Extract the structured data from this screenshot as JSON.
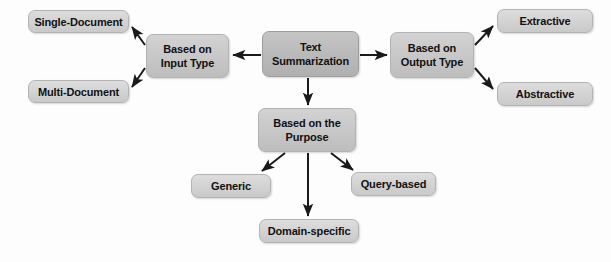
{
  "diagram": {
    "background_color": "#fdfdfd",
    "node_fill_root": "#bcbcbc",
    "node_fill_branch": "#c7c7c7",
    "node_fill_leaf": "#d4d4d4",
    "node_border_color": "#b3b3b3",
    "edge_color": "#1a1a1a",
    "nodes": [
      {
        "id": "text-summarization",
        "label": "Text\nSummarization",
        "role": "root",
        "x": 262,
        "y": 31,
        "w": 97,
        "h": 46
      },
      {
        "id": "based-on-input-type",
        "label": "Based on\nInput Type",
        "role": "branch",
        "x": 146,
        "y": 34,
        "w": 83,
        "h": 44
      },
      {
        "id": "based-on-output-type",
        "label": "Based on\nOutput Type",
        "role": "branch",
        "x": 390,
        "y": 32,
        "w": 84,
        "h": 46
      },
      {
        "id": "based-on-the-purpose",
        "label": "Based on the\nPurpose",
        "role": "branch",
        "x": 258,
        "y": 108,
        "w": 98,
        "h": 44
      },
      {
        "id": "single-document",
        "label": "Single-Document",
        "role": "leaf",
        "x": 28,
        "y": 10,
        "w": 101,
        "h": 23
      },
      {
        "id": "multi-document",
        "label": "Multi-Document",
        "role": "leaf",
        "x": 28,
        "y": 80,
        "w": 101,
        "h": 23
      },
      {
        "id": "extractive",
        "label": "Extractive",
        "role": "leaf",
        "x": 497,
        "y": 9,
        "w": 96,
        "h": 24
      },
      {
        "id": "abstractive",
        "label": "Abstractive",
        "role": "leaf",
        "x": 497,
        "y": 82,
        "w": 96,
        "h": 24
      },
      {
        "id": "generic",
        "label": "Generic",
        "role": "leaf",
        "x": 191,
        "y": 174,
        "w": 80,
        "h": 24
      },
      {
        "id": "query-based",
        "label": "Query-based",
        "role": "leaf",
        "x": 351,
        "y": 172,
        "w": 85,
        "h": 24
      },
      {
        "id": "domain-specific",
        "label": "Domain-specific",
        "role": "leaf",
        "x": 259,
        "y": 219,
        "w": 100,
        "h": 24
      }
    ],
    "edges": [
      {
        "id": "edge-root-to-input-type",
        "from": "text-summarization",
        "to": "based-on-input-type"
      },
      {
        "id": "edge-root-to-output-type",
        "from": "text-summarization",
        "to": "based-on-output-type"
      },
      {
        "id": "edge-root-to-purpose",
        "from": "text-summarization",
        "to": "based-on-the-purpose"
      },
      {
        "id": "edge-input-type-to-single-document",
        "from": "based-on-input-type",
        "to": "single-document"
      },
      {
        "id": "edge-input-type-to-multi-document",
        "from": "based-on-input-type",
        "to": "multi-document"
      },
      {
        "id": "edge-output-type-to-extractive",
        "from": "based-on-output-type",
        "to": "extractive"
      },
      {
        "id": "edge-output-type-to-abstractive",
        "from": "based-on-output-type",
        "to": "abstractive"
      },
      {
        "id": "edge-purpose-to-generic",
        "from": "based-on-the-purpose",
        "to": "generic"
      },
      {
        "id": "edge-purpose-to-query-based",
        "from": "based-on-the-purpose",
        "to": "query-based"
      },
      {
        "id": "edge-purpose-to-domain-specific",
        "from": "based-on-the-purpose",
        "to": "domain-specific"
      }
    ]
  }
}
